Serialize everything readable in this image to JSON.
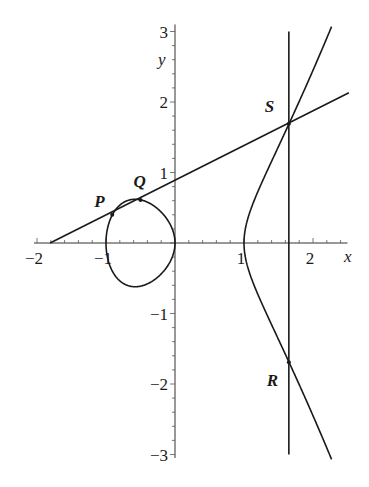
{
  "chart_data": {
    "type": "line",
    "title": "",
    "xlabel": "x",
    "ylabel": "y",
    "xlim": [
      -2,
      2.5
    ],
    "ylim": [
      -3,
      3
    ],
    "grid": false,
    "legend": null,
    "x_ticks": [
      {
        "value": -2,
        "label": "−2"
      },
      {
        "value": -1,
        "label": "−1"
      },
      {
        "value": 1,
        "label": "1"
      },
      {
        "value": 2,
        "label": "2"
      }
    ],
    "y_ticks": [
      {
        "value": -3,
        "label": "−3"
      },
      {
        "value": -2,
        "label": "−2"
      },
      {
        "value": -1,
        "label": "−1"
      },
      {
        "value": 1,
        "label": "1"
      },
      {
        "value": 2,
        "label": "2"
      },
      {
        "value": 3,
        "label": "3"
      }
    ],
    "series": [
      {
        "name": "elliptic curve y^2 = x^3 - x",
        "kind": "curve",
        "equation": "y^2 = x^3 - x",
        "components": [
          {
            "name": "oval",
            "x_range": [
              -1,
              0
            ]
          },
          {
            "name": "unbounded branch",
            "x_range": [
              1,
              2.27
            ]
          }
        ]
      },
      {
        "name": "secant line through P, Q, S",
        "kind": "line",
        "points": [
          [
            -1.81,
            0.0
          ],
          [
            2.52,
            2.13
          ]
        ]
      },
      {
        "name": "vertical line through S and R",
        "kind": "line",
        "points": [
          [
            1.65,
            3.0
          ],
          [
            1.65,
            -3.0
          ]
        ]
      }
    ],
    "annotations": [
      {
        "label": "P",
        "x": -0.91,
        "y": 0.4
      },
      {
        "label": "Q",
        "x": -0.5,
        "y": 0.61
      },
      {
        "label": "S",
        "x": 1.65,
        "y": 1.69
      },
      {
        "label": "R",
        "x": 1.65,
        "y": -1.69
      }
    ]
  }
}
